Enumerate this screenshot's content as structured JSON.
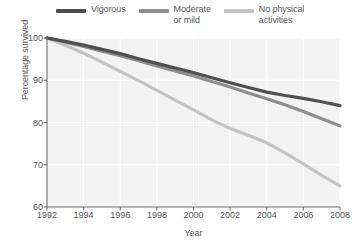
{
  "chart_data": {
    "type": "line",
    "title": "",
    "xlabel": "Year",
    "ylabel": "Percentage survived",
    "xlim": [
      1992,
      2008
    ],
    "ylim": [
      60,
      100
    ],
    "xticks": [
      1992,
      1994,
      1996,
      1998,
      2000,
      2002,
      2004,
      2006,
      2008
    ],
    "yticks": [
      60,
      70,
      80,
      90,
      100
    ],
    "grid": true,
    "legend_position": "top",
    "x": [
      1992,
      1993,
      1994,
      1995,
      1996,
      1997,
      1998,
      1999,
      2000,
      2001,
      2002,
      2003,
      2004,
      2005,
      2006,
      2007,
      2008
    ],
    "series": [
      {
        "name": "Vigorous",
        "color": "#4f4f51",
        "values": [
          100,
          99.2,
          98.3,
          97.3,
          96.3,
          95.1,
          94.0,
          92.9,
          91.8,
          90.6,
          89.4,
          88.3,
          87.2,
          86.4,
          85.7,
          84.9,
          84.0
        ]
      },
      {
        "name": "Moderate or mild",
        "color": "#8d8e90",
        "values": [
          100,
          99.0,
          98.0,
          96.9,
          95.8,
          94.6,
          93.4,
          92.2,
          91.0,
          89.7,
          88.4,
          87.0,
          85.6,
          84.2,
          82.6,
          80.9,
          79.2
        ]
      },
      {
        "name": "No physical activities",
        "color": "#c3c4c6",
        "values": [
          100,
          98.3,
          96.4,
          94.3,
          92.1,
          89.9,
          87.6,
          85.3,
          83.0,
          80.6,
          78.6,
          77.0,
          75.2,
          72.8,
          70.2,
          67.5,
          65.0
        ]
      }
    ]
  },
  "legend": {
    "items": [
      {
        "label": "Vigorous",
        "color": "#4f4f51"
      },
      {
        "label": "Moderate\nor mild",
        "color": "#8d8e90"
      },
      {
        "label": "No physical\nactivities",
        "color": "#c3c4c6"
      }
    ]
  },
  "axes": {
    "y_title": "Percentage survived",
    "x_title": "Year",
    "y_tick_labels": [
      "100",
      "90",
      "80",
      "70",
      "60"
    ],
    "x_tick_labels": [
      "1992",
      "1994",
      "1996",
      "1998",
      "2000",
      "2002",
      "2004",
      "2006",
      "2008"
    ]
  },
  "style": {
    "plot_background": "#f3f3f3",
    "gridline_color": "#ffffff",
    "axis_color": "#6e6e70",
    "text_color": "#58585a"
  }
}
